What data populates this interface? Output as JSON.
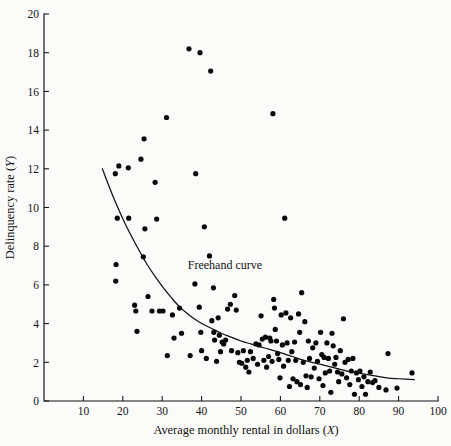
{
  "figure": {
    "background_color": "#fbfbfa",
    "ink_color": "#111111",
    "point_color": "#080808",
    "width": 451,
    "height": 446
  },
  "chart_data": {
    "type": "scatter",
    "title": "",
    "xlabel": "Average monthly rental in dollars (X)",
    "xlabel_text": "Average monthly rental in dollars",
    "xlabel_variable": "X",
    "ylabel": "Delinquency rate (Y)",
    "ylabel_text": "Delinquency rate",
    "ylabel_variable": "Y",
    "xlim": [
      0,
      100
    ],
    "ylim": [
      0,
      20
    ],
    "xticks": [
      10,
      20,
      30,
      40,
      50,
      60,
      70,
      80,
      90,
      100
    ],
    "yticks": [
      0,
      2,
      4,
      6,
      8,
      10,
      12,
      14,
      16,
      18,
      20
    ],
    "xtick_labels": [
      "10",
      "20",
      "30",
      "40",
      "50",
      "60",
      "70",
      "80",
      "90",
      "100"
    ],
    "ytick_labels": [
      "0",
      "2",
      "4",
      "6",
      "8",
      "10",
      "12",
      "14",
      "16",
      "18",
      "20"
    ],
    "grid": false,
    "legend": false,
    "annotations": [
      {
        "text": "Freehand curve",
        "x": 36.5,
        "y": 6.85
      }
    ],
    "series": [
      {
        "name": "Delinquency rate vs average monthly rental",
        "marker": "filled-circle",
        "marker_size_px": 3.0,
        "points": [
          [
            18.1,
            11.75
          ],
          [
            18.6,
            9.45
          ],
          [
            18.3,
            7.05
          ],
          [
            18.2,
            6.2
          ],
          [
            19.0,
            12.15
          ],
          [
            21.4,
            12.05
          ],
          [
            21.5,
            9.45
          ],
          [
            23.0,
            4.95
          ],
          [
            23.3,
            4.65
          ],
          [
            23.6,
            3.6
          ],
          [
            24.6,
            12.5
          ],
          [
            25.4,
            13.55
          ],
          [
            25.6,
            8.9
          ],
          [
            25.2,
            7.45
          ],
          [
            26.4,
            5.4
          ],
          [
            27.4,
            4.65
          ],
          [
            28.2,
            11.3
          ],
          [
            28.6,
            9.4
          ],
          [
            29.3,
            4.65
          ],
          [
            30.2,
            4.65
          ],
          [
            31.1,
            14.65
          ],
          [
            31.3,
            2.35
          ],
          [
            32.6,
            4.45
          ],
          [
            33.0,
            3.25
          ],
          [
            34.4,
            4.8
          ],
          [
            34.9,
            3.5
          ],
          [
            36.8,
            18.2
          ],
          [
            37.1,
            2.35
          ],
          [
            38.5,
            11.75
          ],
          [
            38.3,
            6.05
          ],
          [
            39.4,
            4.85
          ],
          [
            39.6,
            18.0
          ],
          [
            39.8,
            3.55
          ],
          [
            40.0,
            2.6
          ],
          [
            40.7,
            9.0
          ],
          [
            41.2,
            2.2
          ],
          [
            42.0,
            7.5
          ],
          [
            42.3,
            17.05
          ],
          [
            42.6,
            4.15
          ],
          [
            43.0,
            5.85
          ],
          [
            43.1,
            3.55
          ],
          [
            43.3,
            3.15
          ],
          [
            43.8,
            2.05
          ],
          [
            44.2,
            4.3
          ],
          [
            44.5,
            3.4
          ],
          [
            44.8,
            2.55
          ],
          [
            45.2,
            3.05
          ],
          [
            45.6,
            2.95
          ],
          [
            46.1,
            3.15
          ],
          [
            46.6,
            4.75
          ],
          [
            47.3,
            5.0
          ],
          [
            47.6,
            2.6
          ],
          [
            48.4,
            5.45
          ],
          [
            48.8,
            4.7
          ],
          [
            49.2,
            2.5
          ],
          [
            49.6,
            2.0
          ],
          [
            50.2,
            1.95
          ],
          [
            50.6,
            2.6
          ],
          [
            51.2,
            1.75
          ],
          [
            51.6,
            2.1
          ],
          [
            52.0,
            1.5
          ],
          [
            52.4,
            2.55
          ],
          [
            53.1,
            2.2
          ],
          [
            53.8,
            2.95
          ],
          [
            54.2,
            1.9
          ],
          [
            54.6,
            2.9
          ],
          [
            55.1,
            4.4
          ],
          [
            55.4,
            3.2
          ],
          [
            55.8,
            2.1
          ],
          [
            56.2,
            3.3
          ],
          [
            56.5,
            1.75
          ],
          [
            57.0,
            2.3
          ],
          [
            57.3,
            3.25
          ],
          [
            57.6,
            3.1
          ],
          [
            57.9,
            2.05
          ],
          [
            58.1,
            14.85
          ],
          [
            58.3,
            5.25
          ],
          [
            58.5,
            4.8
          ],
          [
            58.7,
            3.7
          ],
          [
            59.0,
            3.1
          ],
          [
            59.3,
            2.45
          ],
          [
            59.6,
            2.15
          ],
          [
            59.9,
            1.2
          ],
          [
            60.2,
            4.45
          ],
          [
            60.5,
            2.9
          ],
          [
            60.8,
            1.8
          ],
          [
            61.1,
            9.45
          ],
          [
            61.4,
            4.55
          ],
          [
            61.7,
            3.0
          ],
          [
            62.0,
            2.1
          ],
          [
            62.3,
            0.75
          ],
          [
            62.6,
            4.3
          ],
          [
            62.9,
            2.55
          ],
          [
            63.2,
            1.15
          ],
          [
            63.6,
            3.05
          ],
          [
            63.9,
            2.1
          ],
          [
            64.2,
            1.0
          ],
          [
            64.6,
            4.5
          ],
          [
            64.9,
            3.55
          ],
          [
            65.1,
            0.85
          ],
          [
            65.4,
            5.6
          ],
          [
            65.8,
            2.0
          ],
          [
            66.2,
            4.1
          ],
          [
            66.5,
            1.3
          ],
          [
            66.8,
            0.7
          ],
          [
            67.1,
            3.1
          ],
          [
            67.4,
            2.2
          ],
          [
            67.8,
            1.25
          ],
          [
            68.2,
            2.75
          ],
          [
            68.6,
            1.7
          ],
          [
            69.0,
            3.0
          ],
          [
            69.4,
            2.05
          ],
          [
            69.8,
            1.15
          ],
          [
            70.2,
            3.55
          ],
          [
            70.5,
            2.4
          ],
          [
            70.8,
            0.8
          ],
          [
            71.1,
            2.25
          ],
          [
            71.4,
            1.45
          ],
          [
            71.8,
            3.0
          ],
          [
            72.2,
            2.2
          ],
          [
            72.5,
            1.55
          ],
          [
            72.8,
            0.45
          ],
          [
            73.1,
            3.5
          ],
          [
            73.4,
            2.85
          ],
          [
            73.8,
            1.9
          ],
          [
            74.1,
            2.25
          ],
          [
            74.5,
            1.5
          ],
          [
            74.8,
            1.0
          ],
          [
            75.2,
            2.6
          ],
          [
            75.6,
            1.4
          ],
          [
            76.0,
            4.25
          ],
          [
            76.4,
            2.0
          ],
          [
            76.8,
            1.2
          ],
          [
            77.2,
            2.15
          ],
          [
            77.6,
            0.85
          ],
          [
            78.0,
            1.55
          ],
          [
            78.4,
            2.2
          ],
          [
            78.8,
            0.35
          ],
          [
            79.3,
            1.45
          ],
          [
            79.8,
            1.1
          ],
          [
            80.2,
            1.55
          ],
          [
            80.7,
            0.75
          ],
          [
            81.2,
            1.25
          ],
          [
            81.6,
            0.35
          ],
          [
            82.2,
            1.0
          ],
          [
            82.8,
            1.5
          ],
          [
            83.4,
            0.95
          ],
          [
            84.0,
            1.05
          ],
          [
            85.0,
            0.7
          ],
          [
            86.8,
            0.57
          ],
          [
            87.3,
            2.45
          ],
          [
            89.6,
            0.67
          ],
          [
            93.4,
            1.45
          ]
        ]
      }
    ],
    "curve": {
      "name": "Freehand curve",
      "label": "Freehand curve",
      "style": "solid",
      "points": [
        [
          14.8,
          12.0
        ],
        [
          16.5,
          11.1
        ],
        [
          18.5,
          10.1
        ],
        [
          20.5,
          9.2
        ],
        [
          22.5,
          8.4
        ],
        [
          24.5,
          7.65
        ],
        [
          26.5,
          6.95
        ],
        [
          28.5,
          6.35
        ],
        [
          30.5,
          5.8
        ],
        [
          32.5,
          5.3
        ],
        [
          34.5,
          4.85
        ],
        [
          36.5,
          4.5
        ],
        [
          38.5,
          4.2
        ],
        [
          40.5,
          3.95
        ],
        [
          42.5,
          3.75
        ],
        [
          45.0,
          3.5
        ],
        [
          47.5,
          3.3
        ],
        [
          50.0,
          3.1
        ],
        [
          52.5,
          2.95
        ],
        [
          55.0,
          2.8
        ],
        [
          57.5,
          2.65
        ],
        [
          60.0,
          2.5
        ],
        [
          63.0,
          2.3
        ],
        [
          66.0,
          2.1
        ],
        [
          69.0,
          1.95
        ],
        [
          72.0,
          1.8
        ],
        [
          75.0,
          1.65
        ],
        [
          78.0,
          1.5
        ],
        [
          81.0,
          1.4
        ],
        [
          84.0,
          1.3
        ],
        [
          87.0,
          1.2
        ],
        [
          90.0,
          1.15
        ],
        [
          94.0,
          1.1
        ]
      ]
    }
  }
}
